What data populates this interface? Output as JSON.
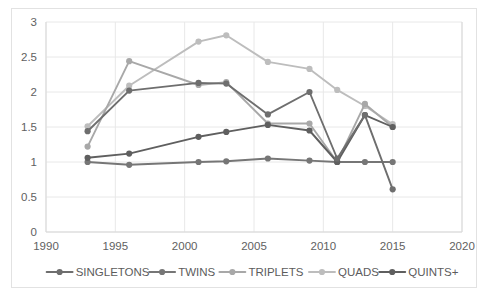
{
  "chart_data": {
    "type": "line",
    "title": "",
    "subtitle": "",
    "xlabel": "",
    "ylabel": "",
    "xlim": [
      1990,
      2020
    ],
    "ylim": [
      0,
      3
    ],
    "xticks": [
      1990,
      1995,
      2000,
      2005,
      2010,
      2015,
      2020
    ],
    "yticks": [
      0,
      0.5,
      1,
      1.5,
      2,
      2.5,
      3
    ],
    "xtick_labels": [
      "1990",
      "1995",
      "2000",
      "2005",
      "2010",
      "2015",
      "2020"
    ],
    "ytick_labels": [
      "0",
      "0.5",
      "1",
      "1.5",
      "2",
      "2.5",
      "3"
    ],
    "grid": true,
    "grid_axis": "y",
    "legend_position": "bottom",
    "x": [
      1993,
      1996,
      2001,
      2003,
      2006,
      2009,
      2011,
      2013,
      2015
    ],
    "series": [
      {
        "name": "SINGLETONS",
        "color": "#6e6e6e",
        "values": [
          1.44,
          2.02,
          2.13,
          2.12,
          1.68,
          2.0,
          1.05,
          1.67,
          0.61
        ]
      },
      {
        "name": "TWINS",
        "color": "#767676",
        "values": [
          1.0,
          0.96,
          1.0,
          1.01,
          1.05,
          1.02,
          1.0,
          1.0,
          1.0
        ]
      },
      {
        "name": "TRIPLETS",
        "color": "#a8a8a8",
        "values": [
          1.22,
          2.44,
          2.1,
          2.14,
          1.55,
          1.55,
          1.0,
          1.83,
          1.5
        ]
      },
      {
        "name": "QUADS",
        "color": "#bdbdbd",
        "values": [
          1.51,
          2.09,
          2.72,
          2.81,
          2.43,
          2.33,
          2.03,
          1.8,
          1.54
        ]
      },
      {
        "name": "QUINTS+",
        "color": "#5f5f5f",
        "values": [
          1.06,
          1.12,
          1.36,
          1.43,
          1.53,
          1.45,
          1.0,
          1.67,
          1.5
        ]
      }
    ]
  },
  "legend": {
    "items": [
      {
        "label": "SINGLETONS",
        "color": "#6e6e6e"
      },
      {
        "label": "TWINS",
        "color": "#767676"
      },
      {
        "label": "TRIPLETS",
        "color": "#a8a8a8"
      },
      {
        "label": "QUADS",
        "color": "#bdbdbd"
      },
      {
        "label": "QUINTS+",
        "color": "#5f5f5f"
      }
    ]
  },
  "colors": {
    "background": "#ffffff",
    "frame_border": "#e2e2e2",
    "gridline": "#e8e8e8",
    "axis": "#d9d9d9",
    "tick_text": "#616161",
    "legend_text": "#5c5c5c"
  }
}
